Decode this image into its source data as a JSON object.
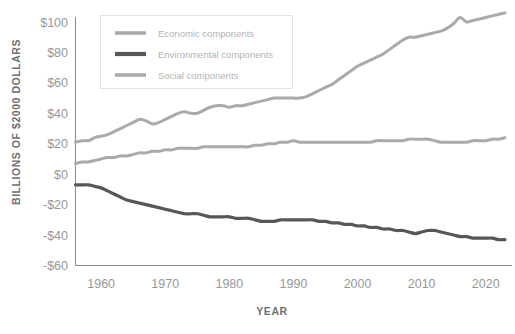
{
  "chart_data": {
    "type": "line",
    "title": "",
    "xlabel": "YEAR",
    "ylabel": "BILLIONS OF $2000 DOLLARS",
    "xlim": [
      1956,
      2023
    ],
    "ylim": [
      -60,
      110
    ],
    "grid": false,
    "legend_position": "top-left",
    "x_ticks": [
      "1960",
      "1970",
      "1980",
      "1990",
      "2000",
      "2010",
      "2020"
    ],
    "x_tick_values": [
      1960,
      1970,
      1980,
      1990,
      2000,
      2010,
      2020
    ],
    "y_ticks": [
      "$100",
      "$80",
      "$60",
      "$40",
      "$20",
      "$0",
      "-$20",
      "-$40",
      "-$60"
    ],
    "y_tick_values": [
      100,
      80,
      60,
      40,
      20,
      0,
      -20,
      -40,
      -60
    ],
    "x": [
      1956,
      1957,
      1958,
      1959,
      1960,
      1961,
      1962,
      1963,
      1964,
      1965,
      1966,
      1967,
      1968,
      1969,
      1970,
      1971,
      1972,
      1973,
      1974,
      1975,
      1976,
      1977,
      1978,
      1979,
      1980,
      1981,
      1982,
      1983,
      1984,
      1985,
      1986,
      1987,
      1988,
      1989,
      1990,
      1991,
      1992,
      1993,
      1994,
      1995,
      1996,
      1997,
      1998,
      1999,
      2000,
      2001,
      2002,
      2003,
      2004,
      2005,
      2006,
      2007,
      2008,
      2009,
      2010,
      2011,
      2012,
      2013,
      2014,
      2015,
      2016,
      2017,
      2018,
      2019,
      2020,
      2021,
      2022,
      2023
    ],
    "series": [
      {
        "name": "Economic components",
        "color": "#a9aaac",
        "values": [
          21,
          22,
          22,
          24,
          25,
          26,
          28,
          30,
          32,
          34,
          36,
          35,
          33,
          34,
          36,
          38,
          40,
          41,
          40,
          40,
          42,
          44,
          45,
          45,
          44,
          45,
          45,
          46,
          47,
          48,
          49,
          50,
          50,
          50,
          50,
          50,
          51,
          53,
          55,
          57,
          59,
          62,
          65,
          68,
          71,
          73,
          75,
          77,
          79,
          82,
          85,
          88,
          90,
          90,
          91,
          92,
          93,
          94,
          96,
          99,
          103,
          100,
          101,
          102,
          103,
          104,
          105,
          106
        ]
      },
      {
        "name": "Environmental components",
        "color": "#575757",
        "values": [
          -7,
          -7,
          -7,
          -8,
          -9,
          -11,
          -13,
          -15,
          -17,
          -18,
          -19,
          -20,
          -21,
          -22,
          -23,
          -24,
          -25,
          -26,
          -26,
          -26,
          -27,
          -28,
          -28,
          -28,
          -28,
          -29,
          -29,
          -29,
          -30,
          -31,
          -31,
          -31,
          -30,
          -30,
          -30,
          -30,
          -30,
          -30,
          -31,
          -31,
          -32,
          -32,
          -33,
          -33,
          -34,
          -34,
          -35,
          -35,
          -36,
          -36,
          -37,
          -37,
          -38,
          -39,
          -38,
          -37,
          -37,
          -38,
          -39,
          -40,
          -41,
          -41,
          -42,
          -42,
          -42,
          -42,
          -43,
          -43
        ]
      },
      {
        "name": "Social components",
        "color": "#a9aaac",
        "values": [
          7,
          8,
          8,
          9,
          10,
          11,
          11,
          12,
          12,
          13,
          14,
          14,
          15,
          15,
          16,
          16,
          17,
          17,
          17,
          17,
          18,
          18,
          18,
          18,
          18,
          18,
          18,
          18,
          19,
          19,
          20,
          20,
          21,
          21,
          22,
          21,
          21,
          21,
          21,
          21,
          21,
          21,
          21,
          21,
          21,
          21,
          21,
          22,
          22,
          22,
          22,
          22,
          23,
          23,
          23,
          23,
          22,
          21,
          21,
          21,
          21,
          21,
          22,
          22,
          22,
          23,
          23,
          24
        ]
      }
    ]
  },
  "legend": {
    "items": [
      {
        "label": "Economic components",
        "color": "#a9aaac"
      },
      {
        "label": "Environmental components",
        "color": "#575757"
      },
      {
        "label": "Social components",
        "color": "#a9aaac"
      }
    ]
  },
  "axes": {
    "y_title": "BILLIONS OF $2000 DOLLARS",
    "x_title": "YEAR"
  }
}
